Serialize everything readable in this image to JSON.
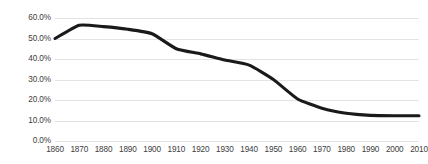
{
  "chart_data": {
    "type": "line",
    "title": "",
    "subtitle": "",
    "xlabel": "",
    "ylabel": "",
    "grid": true,
    "legend": false,
    "legend_position": "none",
    "series_color": "#1a1a1a",
    "xlim": [
      1860,
      2010
    ],
    "ylim": [
      0,
      60
    ],
    "x_tick_labels": [
      "1860",
      "1870",
      "1880",
      "1890",
      "1900",
      "1910",
      "1920",
      "1930",
      "1940",
      "1950",
      "1960",
      "1970",
      "1980",
      "1990",
      "2000",
      "2010"
    ],
    "y_tick_labels": [
      "60.0%",
      "50.0%",
      "40.0%",
      "30.0%",
      "20.0%",
      "10.0%",
      "0.0%"
    ],
    "y_tick_values": [
      60,
      50,
      40,
      30,
      20,
      10,
      0
    ],
    "categories": [
      1860,
      1870,
      1880,
      1890,
      1900,
      1910,
      1920,
      1930,
      1940,
      1950,
      1960,
      1970,
      1980,
      1990,
      2000,
      2010
    ],
    "values": [
      50.0,
      56.5,
      55.8,
      54.5,
      52.3,
      45.0,
      42.5,
      39.5,
      37.0,
      30.0,
      20.5,
      16.0,
      13.5,
      12.5,
      12.3,
      12.3
    ],
    "series": [
      {
        "name": "",
        "values": [
          50.0,
          56.5,
          55.8,
          54.5,
          52.3,
          45.0,
          42.5,
          39.5,
          37.0,
          30.0,
          20.5,
          16.0,
          13.5,
          12.5,
          12.3,
          12.3
        ]
      }
    ]
  }
}
